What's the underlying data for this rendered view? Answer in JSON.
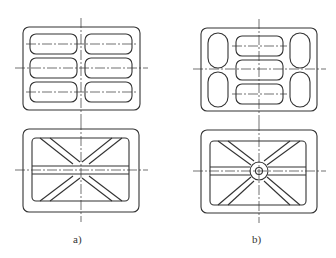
{
  "figure": {
    "panels": [
      {
        "id": "a",
        "label": "a)",
        "top_view": "six rounded slots in 2x3 grid",
        "bottom_view": "X-shaped ribs with horizontal rib"
      },
      {
        "id": "b",
        "label": "b)",
        "top_view": "three central slots with four oval side openings",
        "bottom_view": "X-shaped ribs with central circular hub"
      }
    ],
    "colors": {
      "line": "#333333",
      "background": "#ffffff"
    }
  }
}
